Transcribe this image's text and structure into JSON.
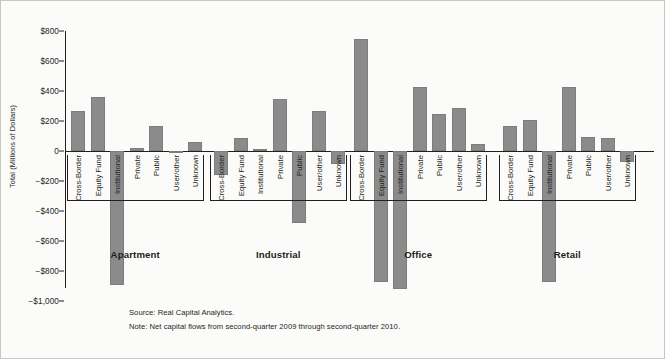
{
  "chart_data": {
    "type": "bar",
    "title": "",
    "xlabel": "",
    "ylabel": "Total (Millions of Dollars)",
    "ylim": [
      -1000,
      800
    ],
    "ytick_values": [
      800,
      600,
      400,
      200,
      0,
      -200,
      -400,
      -600,
      -800,
      -1000
    ],
    "ytick_labels": [
      "$800",
      "$600",
      "$400",
      "$200",
      "0",
      "−$200",
      "−$400",
      "−$600",
      "−$800",
      "−$1,000"
    ],
    "grid": false,
    "legend": "none",
    "bar_color": "#8b8b8b",
    "categories": [
      "Cross-Border",
      "Equity Fund",
      "Institutional",
      "Private",
      "Public",
      "User/other",
      "Unknown"
    ],
    "groups": [
      {
        "name": "Apartment",
        "values": [
          270,
          360,
          -890,
          20,
          165,
          0,
          60
        ]
      },
      {
        "name": "Industrial",
        "values": [
          -160,
          85,
          15,
          350,
          -480,
          265,
          -85
        ]
      },
      {
        "name": "Office",
        "values": [
          750,
          -870,
          -920,
          425,
          245,
          285,
          45
        ]
      },
      {
        "name": "Retail",
        "values": [
          165,
          205,
          -870,
          430,
          95,
          85,
          -75
        ]
      }
    ]
  },
  "footnotes": {
    "source": "Source: Real Capital Analytics.",
    "note": "Note: Net capital flows from second-quarter 2009 through second-quarter 2010."
  }
}
